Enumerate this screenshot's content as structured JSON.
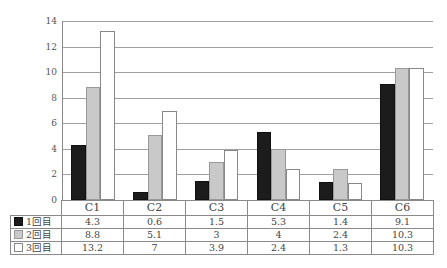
{
  "chart_data": {
    "type": "bar",
    "title": "",
    "xlabel": "",
    "ylabel": "",
    "ylim": [
      0,
      14
    ],
    "yticks": [
      0,
      2,
      4,
      6,
      8,
      10,
      12,
      14
    ],
    "grid": true,
    "legend_position": "data-table",
    "categories": [
      "C1",
      "C2",
      "C3",
      "C4",
      "C5",
      "C6"
    ],
    "series": [
      {
        "name": "1回目",
        "color": "#1c1c1c",
        "values": [
          4.3,
          0.6,
          1.5,
          5.3,
          1.4,
          9.1
        ]
      },
      {
        "name": "2回目",
        "color": "#c9c9c9",
        "values": [
          8.8,
          5.1,
          3,
          4,
          2.4,
          10.3
        ]
      },
      {
        "name": "3回目",
        "color": "#ffffff",
        "values": [
          13.2,
          7,
          3.9,
          2.4,
          1.3,
          10.3
        ]
      }
    ],
    "table_values": [
      [
        "4.3",
        "0.6",
        "1.5",
        "5.3",
        "1.4",
        "9.1"
      ],
      [
        "8.8",
        "5.1",
        "3",
        "4",
        "2.4",
        "10.3"
      ],
      [
        "13.2",
        "7",
        "3.9",
        "2.4",
        "1.3",
        "10.3"
      ]
    ]
  }
}
